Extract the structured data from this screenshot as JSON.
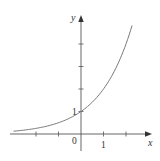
{
  "chart_data": {
    "type": "line",
    "title": "",
    "function": "y = 2^x",
    "xlabel": "x",
    "ylabel": "y",
    "x_tick_labels": [
      {
        "value": 0,
        "label": "0"
      },
      {
        "value": 1,
        "label": "1"
      }
    ],
    "y_tick_labels": [
      {
        "value": 1,
        "label": "1"
      }
    ],
    "x_ticks": [
      -2,
      -1,
      1,
      2
    ],
    "y_ticks": [
      1,
      2,
      3,
      4
    ],
    "xlim": [
      -3.1,
      3.1
    ],
    "ylim": [
      -0.7,
      5.3
    ],
    "grid": false,
    "legend": null,
    "series": [
      {
        "name": "curve",
        "x": [
          -3.0,
          -2.5,
          -2.0,
          -1.5,
          -1.0,
          -0.5,
          0.0,
          0.5,
          1.0,
          1.5,
          2.0,
          2.27
        ],
        "values": [
          0.125,
          0.177,
          0.25,
          0.354,
          0.5,
          0.707,
          1.0,
          1.414,
          2.0,
          2.828,
          4.0,
          4.82
        ]
      }
    ],
    "colors": {
      "curve": "#7a7a7a",
      "axes": "#555555",
      "text": "#333333"
    }
  },
  "labels": {
    "x_axis": "x",
    "y_axis": "y",
    "origin": "0",
    "x_one": "1",
    "y_one": "1"
  }
}
